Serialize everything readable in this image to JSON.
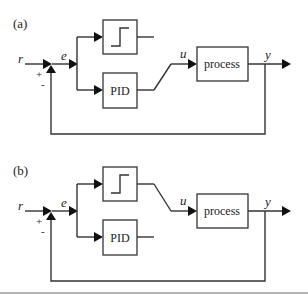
{
  "diagrams": [
    {
      "label": "(a)",
      "description": "Switch selects PID controller output",
      "signals": {
        "reference": "r",
        "error": "e",
        "control": "u",
        "output": "y"
      },
      "sum_signs": {
        "plus": "+",
        "minus": "-"
      },
      "blocks": {
        "switch": "",
        "pid": "PID",
        "process": "process"
      },
      "switch_connected_to": "PID"
    },
    {
      "label": "(b)",
      "description": "Switch selects relay (step) output",
      "signals": {
        "reference": "r",
        "error": "e",
        "control": "u",
        "output": "y"
      },
      "sum_signs": {
        "plus": "+",
        "minus": "-"
      },
      "blocks": {
        "switch": "",
        "pid": "PID",
        "process": "process"
      },
      "switch_connected_to": "relay"
    }
  ],
  "colors": {
    "line": "#333333",
    "arrow": "#111111",
    "text": "#222222",
    "divider": "#999999"
  }
}
